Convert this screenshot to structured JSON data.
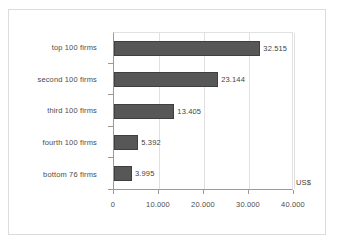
{
  "chart_data": {
    "type": "bar",
    "orientation": "horizontal",
    "title": "",
    "xlabel": "US$",
    "ylabel": "",
    "categories": [
      "top 100 firms",
      "second 100 firms",
      "third 100 firms",
      "fourth 100 firms",
      "bottom 76 firms"
    ],
    "values": [
      32515,
      23144,
      13405,
      5392,
      3995
    ],
    "value_labels": [
      "32.515",
      "23.144",
      "13.405",
      "5.392",
      "3.995"
    ],
    "xlim": [
      0,
      40000
    ],
    "xticks": [
      0,
      10000,
      20000,
      30000,
      40000
    ],
    "xtick_labels": [
      "0",
      "10.000",
      "20.000",
      "30.000",
      "40.000"
    ],
    "grid": true,
    "legend": false,
    "unit": "US$",
    "bar_color": "#575757",
    "bar_border_color": "#3f3f3f",
    "gridline_color": "#e0e0e0",
    "axis_color": "#9a9a9a",
    "text_color": "#4c4c4c",
    "frame_color": "#dcdcdc",
    "background": "#ffffff"
  }
}
